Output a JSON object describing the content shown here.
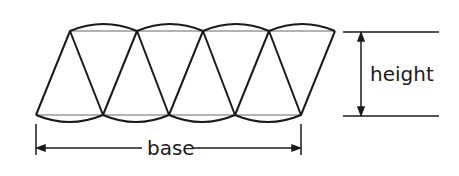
{
  "diagram": {
    "labels": {
      "base": "base",
      "height": "height"
    },
    "colors": {
      "stroke": "#1a1a1a",
      "chord": "#9a9a9a",
      "background": "#ffffff"
    },
    "sectors": {
      "count": 8,
      "top_vertices_x": [
        70,
        137,
        203,
        269,
        335
      ],
      "bottom_vertices_x": [
        36,
        103,
        169,
        235,
        301
      ],
      "top_y": 31,
      "bottom_y": 115
    }
  }
}
